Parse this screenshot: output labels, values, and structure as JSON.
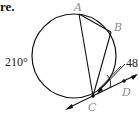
{
  "caption_fragment": "re.",
  "diagram": {
    "points": {
      "A": {
        "label": "A",
        "x": 79,
        "y": 14
      },
      "B": {
        "label": "B",
        "x": 111,
        "y": 32
      },
      "C": {
        "label": "C",
        "x": 93,
        "y": 96
      },
      "D": {
        "label": "D",
        "x": 124,
        "y": 81
      }
    },
    "circle": {
      "cx": 74,
      "cy": 56,
      "r": 42
    },
    "arc_label": "210°",
    "angle_label": "48",
    "colors": {
      "stroke": "#111111",
      "point_label": "#8a8a8a",
      "text": "#222222"
    }
  }
}
